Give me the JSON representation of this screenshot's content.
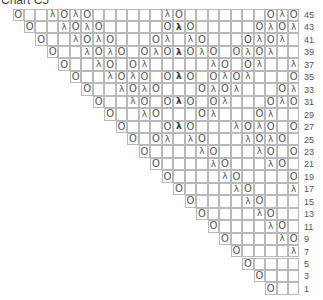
{
  "title": "Chart C5",
  "grid": {
    "columns": 25,
    "left": 13,
    "top": 9,
    "cell_width": 11.48,
    "row_height": 12.45,
    "border_color": "#b9b9b9",
    "symbol_color": "#555555"
  },
  "legend_symbols": {
    "O": "yarn-over",
    "λ": "decrease",
    "λb": "decrease-bold"
  },
  "rows": [
    {
      "number": "45",
      "start": 0,
      "length": 25,
      "symbols": [
        [
          0,
          "O"
        ],
        [
          3,
          "λ"
        ],
        [
          4,
          "O"
        ],
        [
          5,
          "λ"
        ],
        [
          6,
          "O"
        ],
        [
          13,
          "λ"
        ],
        [
          14,
          "O"
        ],
        [
          22,
          "O"
        ],
        [
          23,
          "λ"
        ],
        [
          24,
          "O"
        ]
      ]
    },
    {
      "number": "43",
      "start": 1,
      "length": 24,
      "symbols": [
        [
          0,
          "O"
        ],
        [
          3,
          "λ"
        ],
        [
          4,
          "O"
        ],
        [
          5,
          "λ"
        ],
        [
          6,
          "O"
        ],
        [
          12,
          "O"
        ],
        [
          13,
          "λb"
        ],
        [
          14,
          "O"
        ],
        [
          20,
          "O"
        ],
        [
          21,
          "λ"
        ],
        [
          22,
          "O"
        ],
        [
          23,
          "λ"
        ]
      ]
    },
    {
      "number": "41",
      "start": 2,
      "length": 23,
      "symbols": [
        [
          0,
          "O"
        ],
        [
          3,
          "λ"
        ],
        [
          4,
          "O"
        ],
        [
          5,
          "λ"
        ],
        [
          6,
          "O"
        ],
        [
          10,
          "O"
        ],
        [
          11,
          "λ"
        ],
        [
          13,
          "λ"
        ],
        [
          14,
          "O"
        ],
        [
          18,
          "O"
        ],
        [
          19,
          "λ"
        ],
        [
          20,
          "O"
        ],
        [
          21,
          "λ"
        ]
      ]
    },
    {
      "number": "39",
      "start": 3,
      "length": 22,
      "symbols": [
        [
          0,
          "O"
        ],
        [
          3,
          "λ"
        ],
        [
          4,
          "O"
        ],
        [
          5,
          "λ"
        ],
        [
          6,
          "O"
        ],
        [
          8,
          "O"
        ],
        [
          9,
          "λ"
        ],
        [
          10,
          "O"
        ],
        [
          11,
          "λb"
        ],
        [
          12,
          "O"
        ],
        [
          13,
          "λ"
        ],
        [
          14,
          "O"
        ],
        [
          16,
          "O"
        ],
        [
          17,
          "λ"
        ],
        [
          18,
          "O"
        ],
        [
          19,
          "λ"
        ]
      ]
    },
    {
      "number": "37",
      "start": 4,
      "length": 21,
      "symbols": [
        [
          0,
          "O"
        ],
        [
          3,
          "λ"
        ],
        [
          4,
          "O"
        ],
        [
          6,
          "O"
        ],
        [
          7,
          "λ"
        ],
        [
          13,
          "λ"
        ],
        [
          14,
          "O"
        ],
        [
          16,
          "O"
        ],
        [
          17,
          "λ"
        ],
        [
          20,
          "λ"
        ]
      ]
    },
    {
      "number": "35",
      "start": 5,
      "length": 20,
      "symbols": [
        [
          0,
          "O"
        ],
        [
          3,
          "λ"
        ],
        [
          4,
          "O"
        ],
        [
          5,
          "λ"
        ],
        [
          6,
          "O"
        ],
        [
          8,
          "O"
        ],
        [
          9,
          "λb"
        ],
        [
          10,
          "O"
        ],
        [
          12,
          "O"
        ],
        [
          13,
          "λ"
        ],
        [
          14,
          "O"
        ],
        [
          15,
          "λ"
        ],
        [
          19,
          "O"
        ]
      ]
    },
    {
      "number": "33",
      "start": 6,
      "length": 19,
      "symbols": [
        [
          0,
          "O"
        ],
        [
          3,
          "λ"
        ],
        [
          4,
          "O"
        ],
        [
          5,
          "λ"
        ],
        [
          6,
          "O"
        ],
        [
          10,
          "O"
        ],
        [
          11,
          "λ"
        ],
        [
          12,
          "O"
        ],
        [
          13,
          "λ"
        ],
        [
          17,
          "O"
        ],
        [
          18,
          "λ"
        ]
      ]
    },
    {
      "number": "31",
      "start": 7,
      "length": 18,
      "symbols": [
        [
          0,
          "O"
        ],
        [
          3,
          "λ"
        ],
        [
          4,
          "O"
        ],
        [
          6,
          "O"
        ],
        [
          7,
          "λb"
        ],
        [
          8,
          "O"
        ],
        [
          10,
          "O"
        ],
        [
          11,
          "λ"
        ],
        [
          15,
          "O"
        ],
        [
          16,
          "λ"
        ],
        [
          17,
          "O"
        ]
      ]
    },
    {
      "number": "29",
      "start": 8,
      "length": 17,
      "symbols": [
        [
          0,
          "O"
        ],
        [
          3,
          "λ"
        ],
        [
          4,
          "O"
        ],
        [
          8,
          "O"
        ],
        [
          9,
          "λ"
        ],
        [
          13,
          "O"
        ],
        [
          14,
          "λ"
        ]
      ]
    },
    {
      "number": "27",
      "start": 9,
      "length": 16,
      "symbols": [
        [
          0,
          "O"
        ],
        [
          4,
          "O"
        ],
        [
          5,
          "λb"
        ],
        [
          6,
          "O"
        ],
        [
          10,
          "λ"
        ],
        [
          11,
          "O"
        ],
        [
          12,
          "λ"
        ],
        [
          13,
          "O"
        ],
        [
          15,
          "O"
        ]
      ]
    },
    {
      "number": "25",
      "start": 10,
      "length": 15,
      "symbols": [
        [
          0,
          "O"
        ],
        [
          2,
          "O"
        ],
        [
          3,
          "λ"
        ],
        [
          5,
          "λ"
        ],
        [
          6,
          "O"
        ],
        [
          10,
          "λ"
        ],
        [
          11,
          "O"
        ],
        [
          12,
          "λ"
        ],
        [
          13,
          "O"
        ]
      ]
    },
    {
      "number": "23",
      "start": 11,
      "length": 14,
      "symbols": [
        [
          0,
          "O"
        ],
        [
          5,
          "λ"
        ],
        [
          6,
          "O"
        ],
        [
          10,
          "λ"
        ],
        [
          11,
          "O"
        ],
        [
          13,
          "O"
        ]
      ]
    },
    {
      "number": "21",
      "start": 12,
      "length": 13,
      "symbols": [
        [
          0,
          "O"
        ],
        [
          5,
          "λ"
        ],
        [
          6,
          "O"
        ],
        [
          10,
          "λ"
        ],
        [
          11,
          "O"
        ]
      ]
    },
    {
      "number": "19",
      "start": 13,
      "length": 12,
      "symbols": [
        [
          0,
          "O"
        ],
        [
          5,
          "λ"
        ],
        [
          6,
          "O"
        ],
        [
          11,
          "O"
        ]
      ]
    },
    {
      "number": "17",
      "start": 14,
      "length": 11,
      "symbols": [
        [
          0,
          "O"
        ],
        [
          5,
          "λ"
        ],
        [
          6,
          "O"
        ],
        [
          10,
          "λ"
        ]
      ]
    },
    {
      "number": "15",
      "start": 15,
      "length": 10,
      "symbols": [
        [
          0,
          "O"
        ],
        [
          5,
          "λ"
        ],
        [
          6,
          "O"
        ]
      ]
    },
    {
      "number": "13",
      "start": 16,
      "length": 9,
      "symbols": [
        [
          0,
          "O"
        ],
        [
          5,
          "λ"
        ],
        [
          6,
          "O"
        ]
      ]
    },
    {
      "number": "11",
      "start": 17,
      "length": 8,
      "symbols": [
        [
          0,
          "O"
        ],
        [
          5,
          "λ"
        ],
        [
          6,
          "O"
        ]
      ]
    },
    {
      "number": "9",
      "start": 18,
      "length": 7,
      "symbols": [
        [
          0,
          "O"
        ],
        [
          5,
          "λ"
        ],
        [
          6,
          "O"
        ]
      ]
    },
    {
      "number": "7",
      "start": 19,
      "length": 6,
      "symbols": [
        [
          0,
          "O"
        ],
        [
          5,
          "λ"
        ]
      ]
    },
    {
      "number": "5",
      "start": 20,
      "length": 5,
      "symbols": [
        [
          0,
          "O"
        ]
      ]
    },
    {
      "number": "3",
      "start": 21,
      "length": 4,
      "symbols": [
        [
          0,
          "O"
        ]
      ]
    },
    {
      "number": "1",
      "start": 22,
      "length": 3,
      "symbols": [
        [
          0,
          "O"
        ]
      ]
    }
  ]
}
